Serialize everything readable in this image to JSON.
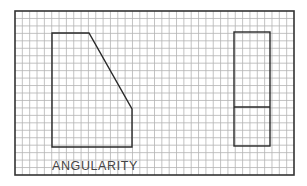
{
  "figure": {
    "label": "ANGULARITY",
    "grid": {
      "x0": 15,
      "y0": 11,
      "x1": 294,
      "y1": 175,
      "cols": 38,
      "rows": 22,
      "line_color": "#b4b4b4",
      "border_color": "#333333"
    },
    "shapes": {
      "front_view": {
        "description": "pentagon with angled (chamfered) upper-right edge",
        "points": [
          [
            52,
            33
          ],
          [
            89,
            33
          ],
          [
            132,
            109
          ],
          [
            132,
            147
          ],
          [
            52,
            147
          ]
        ]
      },
      "side_view": {
        "description": "tall rectangle with horizontal division line",
        "rect": [
          234,
          32,
          270,
          146
        ],
        "divider_y": 107
      }
    },
    "colors": {
      "background": "#ffffff",
      "shape_stroke": "#2a2a2a",
      "label": "#444444"
    }
  }
}
